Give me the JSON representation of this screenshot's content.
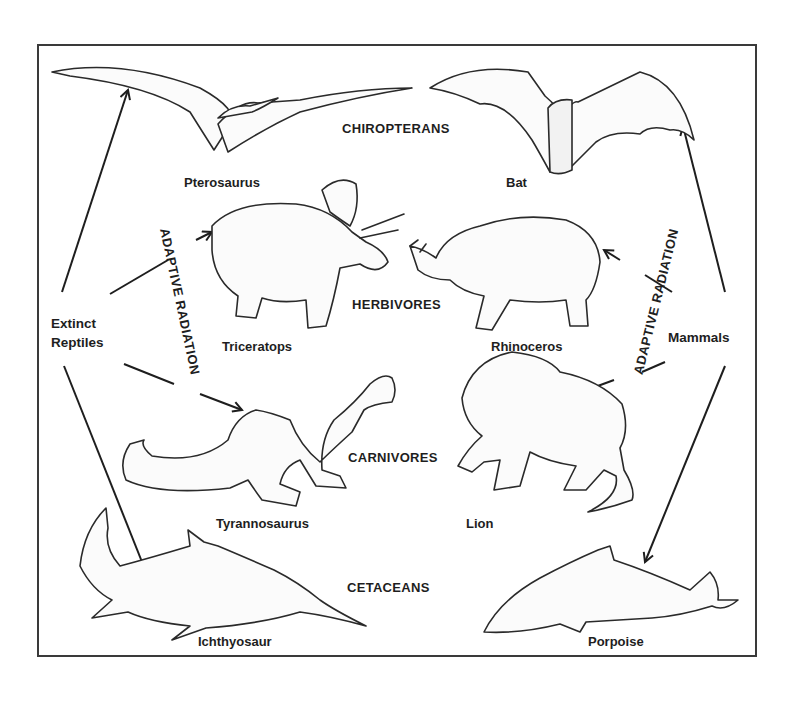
{
  "diagram": {
    "type": "convergent-evolution",
    "sources": {
      "left": "Extinct\nReptiles",
      "left_line1": "Extinct",
      "left_line2": "Reptiles",
      "right": "Mammals"
    },
    "process_label_left": "ADAPTIVE RADIATION",
    "process_label_right": "ADAPTIVE RADIATION",
    "categories": [
      {
        "id": "chiropterans",
        "label": "CHIROPTERANS",
        "reptile": "Pterosaurus",
        "mammal": "Bat"
      },
      {
        "id": "herbivores",
        "label": "HERBIVORES",
        "reptile": "Triceratops",
        "mammal": "Rhinoceros"
      },
      {
        "id": "carnivores",
        "label": "CARNIVORES",
        "reptile": "Tyrannosaurus",
        "mammal": "Lion"
      },
      {
        "id": "cetaceans",
        "label": "CETACEANS",
        "reptile": "Ichthyosaur",
        "mammal": "Porpoise"
      }
    ],
    "arrows": [
      {
        "from": "Extinct Reptiles",
        "to": "Pterosaurus"
      },
      {
        "from": "Extinct Reptiles",
        "to": "Triceratops"
      },
      {
        "from": "Extinct Reptiles",
        "to": "Tyrannosaurus"
      },
      {
        "from": "Extinct Reptiles",
        "to": "Ichthyosaur"
      },
      {
        "from": "Mammals",
        "to": "Bat"
      },
      {
        "from": "Mammals",
        "to": "Rhinoceros"
      },
      {
        "from": "Mammals",
        "to": "Lion"
      },
      {
        "from": "Mammals",
        "to": "Porpoise"
      }
    ],
    "colors": {
      "ink": "#1e1e1e",
      "frame": "#3a3a3a",
      "background": "#ffffff"
    }
  }
}
